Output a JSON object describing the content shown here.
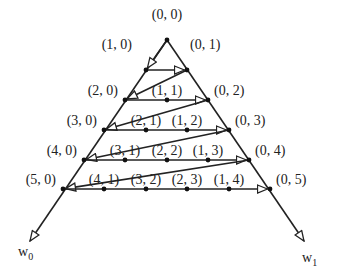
{
  "diagram": {
    "type": "triangular lattice traversal (zig-zag ordering)",
    "axes": [
      {
        "id": "w0",
        "label": "w",
        "subscript": "0",
        "direction": "down-left"
      },
      {
        "id": "w1",
        "label": "w",
        "subscript": "1",
        "direction": "down-right"
      }
    ],
    "nodes": [
      {
        "id": "0,0",
        "label": "(0, 0)",
        "x": 167,
        "y": 40,
        "lx": 167,
        "ly": 16,
        "anchor": "middle"
      },
      {
        "id": "1,0",
        "label": "(1, 0)",
        "x": 146,
        "y": 70,
        "lx": 132,
        "ly": 46,
        "anchor": "end"
      },
      {
        "id": "0,1",
        "label": "(0, 1)",
        "x": 187,
        "y": 70,
        "lx": 190,
        "ly": 46,
        "anchor": "start"
      },
      {
        "id": "2,0",
        "label": "(2, 0)",
        "x": 125,
        "y": 100,
        "lx": 118,
        "ly": 92,
        "anchor": "end"
      },
      {
        "id": "1,1",
        "label": "(1, 1)",
        "x": 167,
        "y": 100,
        "lx": 167,
        "ly": 92,
        "anchor": "middle"
      },
      {
        "id": "0,2",
        "label": "(0, 2)",
        "x": 208,
        "y": 100,
        "lx": 214,
        "ly": 92,
        "anchor": "start"
      },
      {
        "id": "3,0",
        "label": "(3, 0)",
        "x": 104,
        "y": 130,
        "lx": 97,
        "ly": 122,
        "anchor": "end"
      },
      {
        "id": "2,1",
        "label": "(2, 1)",
        "x": 146,
        "y": 130,
        "lx": 146,
        "ly": 122,
        "anchor": "middle"
      },
      {
        "id": "1,2",
        "label": "(1, 2)",
        "x": 187,
        "y": 130,
        "lx": 187,
        "ly": 122,
        "anchor": "middle"
      },
      {
        "id": "0,3",
        "label": "(0, 3)",
        "x": 229,
        "y": 130,
        "lx": 235,
        "ly": 122,
        "anchor": "start"
      },
      {
        "id": "4,0",
        "label": "(4, 0)",
        "x": 84,
        "y": 160,
        "lx": 77,
        "ly": 152,
        "anchor": "end"
      },
      {
        "id": "3,1",
        "label": "(3, 1)",
        "x": 125,
        "y": 160,
        "lx": 125,
        "ly": 152,
        "anchor": "middle"
      },
      {
        "id": "2,2",
        "label": "(2, 2)",
        "x": 167,
        "y": 160,
        "lx": 167,
        "ly": 152,
        "anchor": "middle"
      },
      {
        "id": "1,3",
        "label": "(1, 3)",
        "x": 208,
        "y": 160,
        "lx": 208,
        "ly": 152,
        "anchor": "middle"
      },
      {
        "id": "0,4",
        "label": "(0, 4)",
        "x": 249,
        "y": 160,
        "lx": 255,
        "ly": 152,
        "anchor": "start"
      },
      {
        "id": "5,0",
        "label": "(5, 0)",
        "x": 63,
        "y": 189,
        "lx": 56,
        "ly": 181,
        "anchor": "end"
      },
      {
        "id": "4,1",
        "label": "(4, 1)",
        "x": 104,
        "y": 189,
        "lx": 104,
        "ly": 181,
        "anchor": "middle"
      },
      {
        "id": "3,2",
        "label": "(3, 2)",
        "x": 146,
        "y": 189,
        "lx": 146,
        "ly": 181,
        "anchor": "middle"
      },
      {
        "id": "2,3",
        "label": "(2, 3)",
        "x": 187,
        "y": 189,
        "lx": 187,
        "ly": 181,
        "anchor": "middle"
      },
      {
        "id": "1,4",
        "label": "(1, 4)",
        "x": 229,
        "y": 189,
        "lx": 229,
        "ly": 181,
        "anchor": "middle"
      },
      {
        "id": "0,5",
        "label": "(0, 5)",
        "x": 270,
        "y": 189,
        "lx": 276,
        "ly": 181,
        "anchor": "start"
      }
    ],
    "traversal": [
      {
        "from": "0,0",
        "to": "1,0",
        "arrow": true
      },
      {
        "from": "1,0",
        "to": "0,1",
        "arrow": true
      },
      {
        "from": "0,1",
        "to": "2,0",
        "arrow": true
      },
      {
        "from": "2,0",
        "to": "0,2",
        "arrow": true
      },
      {
        "from": "0,2",
        "to": "3,0",
        "arrow": true
      },
      {
        "from": "3,0",
        "to": "0,3",
        "arrow": true
      },
      {
        "from": "0,3",
        "to": "4,0",
        "arrow": true
      },
      {
        "from": "4,0",
        "to": "0,4",
        "arrow": true
      },
      {
        "from": "0,4",
        "to": "5,0",
        "arrow": true
      },
      {
        "from": "5,0",
        "to": "0,5",
        "arrow": true
      }
    ],
    "axis_lines": [
      {
        "from": [
          167,
          40
        ],
        "to": [
          30,
          241
        ],
        "label_pos": [
          18,
          256
        ]
      },
      {
        "from": [
          167,
          40
        ],
        "to": [
          304,
          241
        ],
        "label_pos": [
          302,
          262
        ]
      }
    ]
  }
}
